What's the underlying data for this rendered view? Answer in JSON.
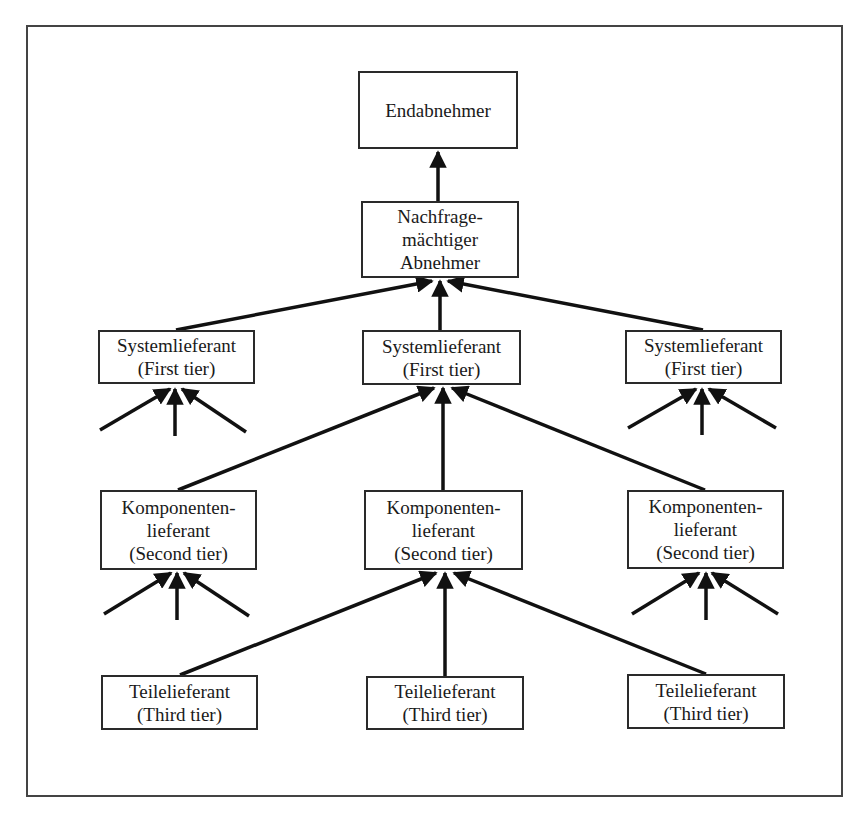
{
  "diagram": {
    "type": "supply-chain-hierarchy",
    "nodes": {
      "end_customer": {
        "lines": [
          "Endabnehmer"
        ]
      },
      "powerful_buyer": {
        "lines": [
          "Nachfrage-",
          "mächtiger",
          "Abnehmer"
        ]
      },
      "first_tier_left": {
        "lines": [
          "Systemlieferant",
          "(First tier)"
        ]
      },
      "first_tier_mid": {
        "lines": [
          "Systemlieferant",
          "(First tier)"
        ]
      },
      "first_tier_right": {
        "lines": [
          "Systemlieferant",
          "(First tier)"
        ]
      },
      "second_tier_left": {
        "lines": [
          "Komponenten-",
          "lieferant",
          "(Second tier)"
        ]
      },
      "second_tier_mid": {
        "lines": [
          "Komponenten-",
          "lieferant",
          "(Second tier)"
        ]
      },
      "second_tier_right": {
        "lines": [
          "Komponenten-",
          "lieferant",
          "(Second tier)"
        ]
      },
      "third_tier_left": {
        "lines": [
          "Teilelieferant",
          "(Third tier)"
        ]
      },
      "third_tier_mid": {
        "lines": [
          "Teilelieferant",
          "(Third tier)"
        ]
      },
      "third_tier_right": {
        "lines": [
          "Teilelieferant",
          "(Third tier)"
        ]
      }
    },
    "edges": [
      [
        "powerful_buyer",
        "end_customer"
      ],
      [
        "first_tier_left",
        "powerful_buyer"
      ],
      [
        "first_tier_mid",
        "powerful_buyer"
      ],
      [
        "first_tier_right",
        "powerful_buyer"
      ],
      [
        "second_tier_left",
        "first_tier_mid"
      ],
      [
        "second_tier_mid",
        "first_tier_mid"
      ],
      [
        "second_tier_right",
        "first_tier_mid"
      ],
      [
        "third_tier_left",
        "second_tier_mid"
      ],
      [
        "third_tier_mid",
        "second_tier_mid"
      ],
      [
        "third_tier_right",
        "second_tier_mid"
      ]
    ],
    "colors": {
      "line": "#111111",
      "border": "#2a2a2a",
      "background": "#ffffff"
    }
  }
}
